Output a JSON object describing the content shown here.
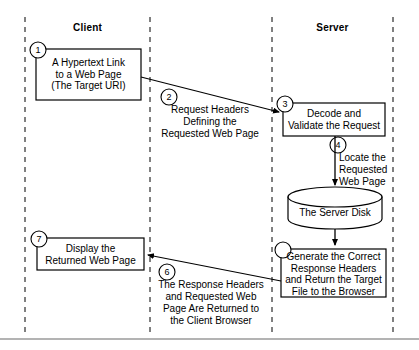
{
  "diagram": {
    "lanes": [
      {
        "id": "client",
        "label": "Client"
      },
      {
        "id": "server",
        "label": "Server"
      }
    ],
    "nodes": [
      {
        "id": "node-1",
        "step": "1",
        "shape": "rectangle",
        "lane": "client",
        "lines": [
          "A Hypertext Link",
          "to a Web Page",
          "(The Target URI)"
        ]
      },
      {
        "id": "node-3",
        "step": "3",
        "shape": "rectangle",
        "lane": "server",
        "lines": [
          "Decode and",
          "Validate the Request"
        ]
      },
      {
        "id": "node-disk",
        "step": "",
        "shape": "cylinder",
        "lane": "server",
        "lines": [
          "The Server Disk"
        ]
      },
      {
        "id": "node-5",
        "step": "5",
        "shape": "rectangle",
        "lane": "server",
        "lines": [
          "Generate the Correct",
          "Response Headers",
          "and Return the Target",
          "File to the Browser"
        ]
      },
      {
        "id": "node-7",
        "step": "7",
        "shape": "rectangle",
        "lane": "client",
        "lines": [
          "Display the",
          "Returned Web Page"
        ]
      }
    ],
    "flows": [
      {
        "id": "flow-2",
        "step": "2",
        "from": "node-1",
        "to": "node-3",
        "lines": [
          "Request Headers",
          "Defining the",
          "Requested Web Page"
        ]
      },
      {
        "id": "flow-4",
        "step": "4",
        "from": "node-3",
        "to": "node-disk",
        "lines": [
          "Locate the",
          "Requested",
          "Web Page"
        ]
      },
      {
        "id": "flow-6",
        "step": "6",
        "from": "node-5",
        "to": "node-7",
        "lines": [
          "The Response Headers",
          "and Requested Web",
          "Page Are Returned to",
          "the Client Browser"
        ]
      }
    ],
    "colors": {
      "stroke": "#000000",
      "text": "#000000",
      "background": "#ffffff",
      "divider": "#000000"
    }
  }
}
